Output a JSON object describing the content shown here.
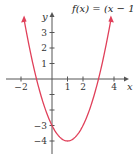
{
  "chart_data": {
    "type": "line",
    "title_parts": {
      "pre": "f(x) = (x − 1)",
      "sup": "2",
      "post": " − 4"
    },
    "xlabel": "x",
    "ylabel": "y",
    "x_ticks": [
      -2,
      1,
      2,
      4
    ],
    "x_tick_labels": [
      "−2",
      "1",
      "2",
      "4"
    ],
    "y_ticks": [
      3,
      2,
      1,
      -1,
      -2,
      -3,
      -4
    ],
    "y_tick_labels": [
      "3",
      "2",
      "1",
      "",
      "",
      "−3",
      "−4"
    ],
    "xlim": [
      -2.5,
      4.6
    ],
    "ylim": [
      -4.3,
      4.0
    ],
    "grid": false,
    "series": [
      {
        "name": "f(x) = (x − 1)² − 4",
        "color": "#e0405a",
        "x": [
          -1.8,
          -1,
          0,
          1,
          2,
          3,
          3.8
        ],
        "y": [
          3.84,
          0,
          -3,
          -4,
          -3,
          0,
          3.84
        ]
      }
    ]
  },
  "colors": {
    "curve": "#e0405a",
    "axis": "#555555"
  }
}
